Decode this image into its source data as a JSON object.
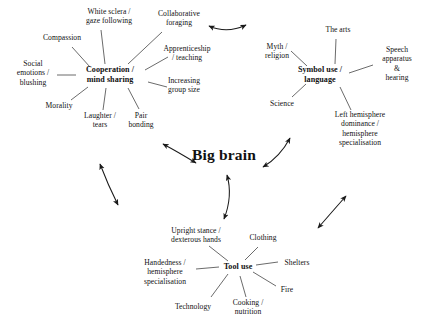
{
  "diagram": {
    "title": "Big brain",
    "center": {
      "label": "Big brain",
      "x": 224,
      "y": 155
    },
    "hubs": [
      {
        "id": "cooperation",
        "label": "Cooperation /\nmind sharing",
        "x": 110,
        "y": 75,
        "spokes": [
          {
            "label": "White sclera /\ngaze following",
            "x": 109,
            "y": 16
          },
          {
            "label": "Collaborative\nforaging",
            "x": 179,
            "y": 18
          },
          {
            "label": "Compassion",
            "x": 62,
            "y": 38
          },
          {
            "label": "Apprenticeship\n/ teaching",
            "x": 187,
            "y": 53
          },
          {
            "label": "Social\nemotions /\nblushing",
            "x": 33,
            "y": 73
          },
          {
            "label": "Increasing\ngroup size",
            "x": 184,
            "y": 85
          },
          {
            "label": "Morality",
            "x": 59,
            "y": 106
          },
          {
            "label": "Laughter /\ntears",
            "x": 100,
            "y": 120
          },
          {
            "label": "Pair\nbonding",
            "x": 141,
            "y": 120
          }
        ]
      },
      {
        "id": "symbol-use",
        "label": "Symbol use /\nlanguage",
        "x": 320,
        "y": 75,
        "spokes": [
          {
            "label": "The arts",
            "x": 338,
            "y": 30
          },
          {
            "label": "Myth /\nreligion",
            "x": 277,
            "y": 51
          },
          {
            "label": "Speech\napparatus\n& hearing",
            "x": 397,
            "y": 63
          },
          {
            "label": "Science",
            "x": 282,
            "y": 104
          },
          {
            "label": "Left hemisphere\ndominance /\nhemisphere\nspecialisation",
            "x": 360,
            "y": 128
          }
        ]
      },
      {
        "id": "tool-use",
        "label": "Tool use",
        "x": 238,
        "y": 267,
        "spokes": [
          {
            "label": "Upright stance /\ndexterous hands",
            "x": 196,
            "y": 235
          },
          {
            "label": "Clothing",
            "x": 263,
            "y": 238
          },
          {
            "label": "Shelters",
            "x": 297,
            "y": 263
          },
          {
            "label": "Handedness /\nhemisphere\nspecialisation",
            "x": 165,
            "y": 272
          },
          {
            "label": "Fire",
            "x": 287,
            "y": 290
          },
          {
            "label": "Technology",
            "x": 193,
            "y": 307
          },
          {
            "label": "Cooking /\nnutrition",
            "x": 248,
            "y": 307
          }
        ]
      }
    ],
    "connectors": [
      {
        "id": "cooperation-to-symbol",
        "from": "cooperation",
        "to": "symbol-use",
        "double_headed": true
      },
      {
        "id": "cooperation-to-big-brain",
        "from": "cooperation",
        "to": "center",
        "double_headed": true
      },
      {
        "id": "symbol-to-big-brain",
        "from": "symbol-use",
        "to": "center",
        "double_headed": true
      },
      {
        "id": "cooperation-to-tool",
        "from": "cooperation",
        "to": "tool-use",
        "double_headed": true
      },
      {
        "id": "symbol-to-tool",
        "from": "symbol-use",
        "to": "tool-use",
        "double_headed": true
      },
      {
        "id": "big-brain-to-tool",
        "from": "center",
        "to": "tool-use",
        "double_headed": true
      }
    ],
    "colors": {
      "background": "#ffffff",
      "text": "#111111",
      "line": "#3a3a3a",
      "arrow": "#1a1a1a"
    }
  }
}
